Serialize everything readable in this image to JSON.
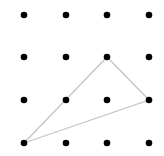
{
  "diagram": {
    "type": "dot-grid-triangle",
    "grid": {
      "rows": 4,
      "cols": 4,
      "x": [
        24,
        66,
        107,
        149
      ],
      "y": [
        15,
        57,
        100,
        143
      ],
      "dot_radius": 3.3,
      "dot_color": "#000000"
    },
    "triangle": {
      "vertices": [
        {
          "col": 0,
          "row": 3
        },
        {
          "col": 2,
          "row": 1
        },
        {
          "col": 3,
          "row": 2
        }
      ],
      "stroke_color": "#c4c4c4",
      "stroke_width": 1.3
    }
  }
}
